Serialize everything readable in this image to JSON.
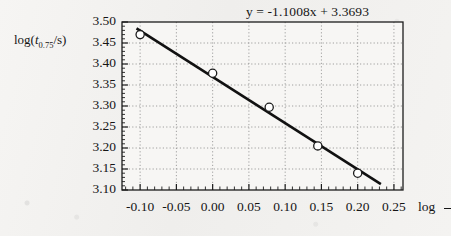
{
  "chart_data": {
    "type": "scatter",
    "title": "",
    "equation": "y = -1.1008x + 3.3693",
    "slope": -1.1008,
    "intercept": 3.3693,
    "xlabel": "log",
    "xlabel_truncated": true,
    "ylabel_parts": {
      "prefix": "log(",
      "variable": "t",
      "subscript": "0.75",
      "suffix": "/s)"
    },
    "ylabel": "log(t0.75/s)",
    "xlim": [
      -0.125,
      0.2625
    ],
    "ylim": [
      3.1,
      3.5
    ],
    "xticks": [
      -0.1,
      -0.05,
      0.0,
      0.05,
      0.1,
      0.15,
      0.2,
      0.25
    ],
    "xtick_labels": [
      "-0.10",
      "-0.05",
      "0.00",
      "0.05",
      "0.10",
      "0.15",
      "0.20",
      "0.25"
    ],
    "yticks": [
      3.1,
      3.15,
      3.2,
      3.25,
      3.3,
      3.35,
      3.4,
      3.45,
      3.5
    ],
    "ytick_labels": [
      "3.10",
      "3.15",
      "3.20",
      "3.25",
      "3.30",
      "3.35",
      "3.40",
      "3.45",
      "3.50"
    ],
    "x_minor_ticks_per_major": 5,
    "y_minor_ticks_per_major": 5,
    "grid": true,
    "grid_style": "dotted",
    "legend": null,
    "marker": "open-circle",
    "x": [
      -0.1,
      0.0,
      0.078,
      0.145,
      0.2
    ],
    "y": [
      3.47,
      3.378,
      3.297,
      3.205,
      3.14
    ],
    "points": [
      {
        "x": -0.1,
        "y": 3.47
      },
      {
        "x": 0.0,
        "y": 3.378
      },
      {
        "x": 0.078,
        "y": 3.297
      },
      {
        "x": 0.145,
        "y": 3.205
      },
      {
        "x": 0.2,
        "y": 3.14
      }
    ],
    "fit_line": {
      "x_start": -0.105,
      "x_end": 0.232,
      "y_start": 3.4849,
      "y_end": 3.114
    },
    "colors": {
      "axis": "#1c1c1c",
      "line": "#111111",
      "marker_stroke": "#1c1c1c",
      "marker_fill": "#ffffff",
      "grid": "#8a8a8a",
      "background": "#f3f2f0",
      "plot_background": "#f7f6f4",
      "text": "#151515"
    }
  }
}
